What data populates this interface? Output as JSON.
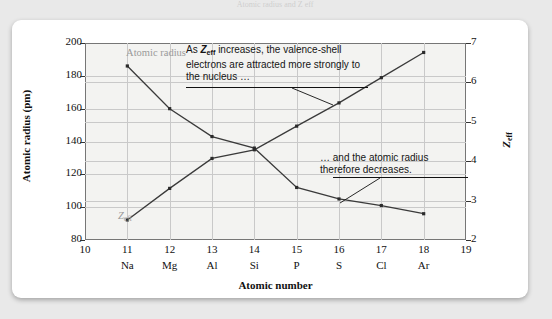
{
  "figure": {
    "top_clipped_text": "Atomic radius and Z eff",
    "callouts": {
      "zeff_note_pre": "As ",
      "zeff_note_sym": "Z",
      "zeff_note_sub": "eff",
      "zeff_note_post": " increases, the valence-shell electrons are attracted more strongly to the nucleus …",
      "radius_note": "… and the atomic radius therefore decreases."
    },
    "series_labels": {
      "atomic_radius": "Atomic radius",
      "zeff_sym": "Z",
      "zeff_sub": "eff"
    }
  },
  "chart_data": {
    "type": "line",
    "title": "",
    "xlabel": "Atomic number",
    "ylabel": "Atomic radius (pm)",
    "y2label": "Z_eff",
    "grid": true,
    "legend": "inline-labels",
    "x": [
      11,
      12,
      13,
      14,
      15,
      16,
      17,
      18
    ],
    "x_symbols": [
      "Na",
      "Mg",
      "Al",
      "Si",
      "P",
      "S",
      "Cl",
      "Ar"
    ],
    "xlim": [
      10,
      19
    ],
    "xticks": [
      10,
      11,
      12,
      13,
      14,
      15,
      16,
      17,
      18,
      19
    ],
    "xticklabels": [
      "10",
      "11",
      "12",
      "13",
      "14",
      "15",
      "16",
      "17",
      "18",
      "19"
    ],
    "ylim": [
      80,
      200
    ],
    "yticks": [
      80,
      100,
      120,
      140,
      160,
      180,
      200
    ],
    "yticklabels": [
      "80",
      "100",
      "120",
      "140",
      "160",
      "180",
      "200"
    ],
    "y2lim": [
      2,
      7
    ],
    "y2ticks": [
      2,
      3,
      4,
      5,
      6,
      7
    ],
    "y2ticklabels": [
      "2",
      "3",
      "4",
      "5",
      "6",
      "7"
    ],
    "series": [
      {
        "name": "Atomic radius",
        "axis": "left",
        "units": "pm",
        "values": [
          186,
          160,
          143,
          136,
          112,
          105,
          101,
          96
        ]
      },
      {
        "name": "Z_eff",
        "axis": "right",
        "units": "",
        "values": [
          2.51,
          3.31,
          4.07,
          4.29,
          4.89,
          5.48,
          6.12,
          6.76
        ]
      }
    ]
  },
  "axis_label_colors": {
    "series_label": "#9a9a9a",
    "line": "#3a3a3a",
    "grid": "#c9c9c9",
    "plot_bg": "#f3f3f1",
    "card_bg": "#ffffff",
    "page_bg": "#e9e9e9"
  }
}
